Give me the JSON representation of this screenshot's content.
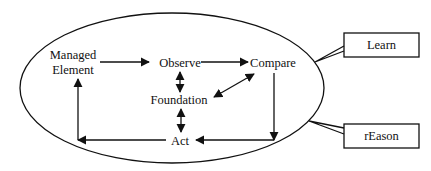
{
  "diagram": {
    "nodes": {
      "managed_element": {
        "line1": "Managed",
        "line2": "Element"
      },
      "observe": "Observe",
      "compare": "Compare",
      "foundation": "Foundation",
      "act": "Act"
    },
    "callouts": {
      "learn": "Learn",
      "reason": "rEason"
    },
    "edges": [
      {
        "from": "Managed Element",
        "to": "Observe",
        "type": "directed"
      },
      {
        "from": "Observe",
        "to": "Compare",
        "type": "directed"
      },
      {
        "from": "Observe",
        "to": "Foundation",
        "type": "bidirectional"
      },
      {
        "from": "Compare",
        "to": "Foundation",
        "type": "bidirectional"
      },
      {
        "from": "Foundation",
        "to": "Act",
        "type": "bidirectional"
      },
      {
        "from": "Compare",
        "to": "Act",
        "type": "directed"
      },
      {
        "from": "Act",
        "to": "Managed Element",
        "type": "directed"
      }
    ],
    "colors": {
      "stroke": "#111111",
      "background": "#ffffff"
    }
  }
}
